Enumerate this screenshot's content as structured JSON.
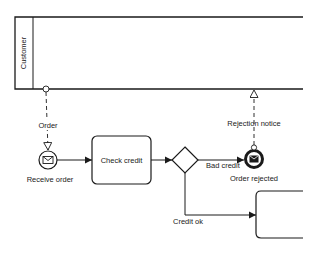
{
  "diagram": {
    "type": "BPMN collaboration",
    "colors": {
      "stroke": "#1a1a1a",
      "background": "#ffffff",
      "text": "#222222"
    },
    "pool": {
      "label": "Customer"
    },
    "message_flows": [
      {
        "label": "Order",
        "from": "Customer",
        "to": "Receive order"
      },
      {
        "label": "Rejection notice",
        "from": "Order rejected",
        "to": "Customer"
      }
    ],
    "nodes": {
      "start_event": {
        "label": "Receive order",
        "icon": "envelope-icon"
      },
      "task_check_credit": {
        "label": "Check credit"
      },
      "gateway": {
        "label": ""
      },
      "end_event": {
        "label": "Order rejected",
        "icon": "filled-envelope-icon"
      },
      "task_partial": {
        "label": ""
      }
    },
    "sequence_flows": [
      {
        "label": "",
        "from": "Receive order",
        "to": "Check credit"
      },
      {
        "label": "",
        "from": "Check credit",
        "to": "gateway"
      },
      {
        "label": "Bad credit",
        "from": "gateway",
        "to": "Order rejected"
      },
      {
        "label": "Credit ok",
        "from": "gateway",
        "to": "next task"
      }
    ]
  }
}
